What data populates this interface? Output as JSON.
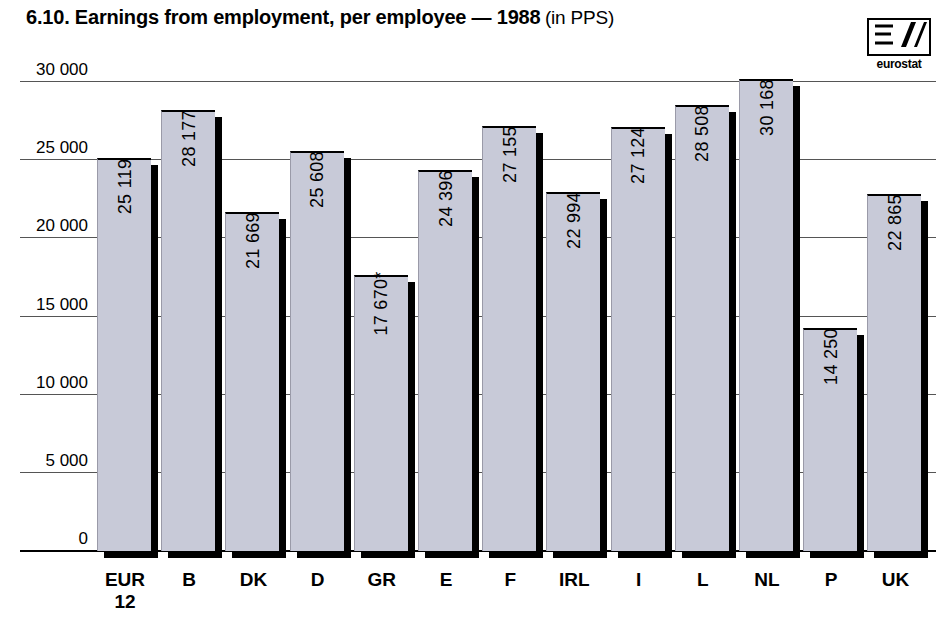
{
  "title": {
    "main": "6.10. Earnings from employment, per employee — 1988",
    "sub": "(in PPS)"
  },
  "logo": {
    "caption": "eurostat",
    "name": "eurostat-logo"
  },
  "chart_data": {
    "type": "bar",
    "title": "6.10. Earnings from employment, per employee — 1988 (in PPS)",
    "xlabel": "",
    "ylabel": "",
    "unit": "PPS",
    "year": "1988",
    "ylim": [
      0,
      30000
    ],
    "yticks": [
      0,
      5000,
      10000,
      15000,
      20000,
      25000,
      30000
    ],
    "ytick_labels": [
      "0",
      "5 000",
      "10 000",
      "15 000",
      "20 000",
      "25 000",
      "30 000"
    ],
    "grid": true,
    "legend": null,
    "categories": [
      "EUR 12",
      "B",
      "DK",
      "D",
      "GR",
      "E",
      "F",
      "IRL",
      "I",
      "L",
      "NL",
      "P",
      "UK"
    ],
    "category_labels": [
      {
        "line1": "EUR",
        "line2": "12"
      },
      {
        "line1": "B",
        "line2": ""
      },
      {
        "line1": "DK",
        "line2": ""
      },
      {
        "line1": "D",
        "line2": ""
      },
      {
        "line1": "GR",
        "line2": ""
      },
      {
        "line1": "E",
        "line2": ""
      },
      {
        "line1": "F",
        "line2": ""
      },
      {
        "line1": "IRL",
        "line2": ""
      },
      {
        "line1": "I",
        "line2": ""
      },
      {
        "line1": "L",
        "line2": ""
      },
      {
        "line1": "NL",
        "line2": ""
      },
      {
        "line1": "P",
        "line2": ""
      },
      {
        "line1": "UK",
        "line2": ""
      }
    ],
    "values": [
      25119,
      28177,
      21669,
      25608,
      17670,
      24396,
      27155,
      22994,
      27124,
      28508,
      30168,
      14250,
      22865
    ],
    "value_labels": [
      "25 119",
      "28 177",
      "21 669",
      "25 608",
      "17 670*",
      "24 396",
      "27 155",
      "22 994",
      "27 124",
      "28 508",
      "30 168",
      "14 250",
      "22 865"
    ],
    "footnote": "* provisional",
    "colors": {
      "bar_fill": "#c8cad8",
      "bar_outline": "#000000",
      "shadow": "#000000",
      "gridline": "#555555",
      "background": "#ffffff"
    }
  }
}
